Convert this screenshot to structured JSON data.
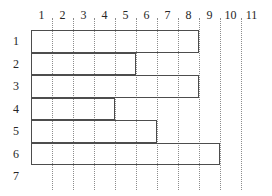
{
  "chart_data": {
    "type": "bar",
    "orientation": "horizontal",
    "title": "",
    "xlabel": "",
    "ylabel": "",
    "grid": true,
    "legend": null,
    "column_headers": [
      "1",
      "2",
      "3",
      "4",
      "5",
      "6",
      "7",
      "8",
      "9",
      "10",
      "11"
    ],
    "row_labels": [
      "1",
      "2",
      "3",
      "4",
      "5",
      "6",
      "7"
    ],
    "categories": [
      "1",
      "2",
      "3",
      "4",
      "5",
      "6",
      "7"
    ],
    "values": [
      8,
      5,
      8,
      4,
      6,
      9,
      0
    ],
    "xlim": [
      1,
      11
    ],
    "ylim": [
      1,
      7
    ],
    "bars": [
      {
        "row": "1",
        "start": 1,
        "end": 9,
        "length": 8
      },
      {
        "row": "2",
        "start": 1,
        "end": 6,
        "length": 5
      },
      {
        "row": "3",
        "start": 1,
        "end": 9,
        "length": 8
      },
      {
        "row": "4",
        "start": 1,
        "end": 5,
        "length": 4
      },
      {
        "row": "5",
        "start": 1,
        "end": 7,
        "length": 6
      },
      {
        "row": "6",
        "start": 1,
        "end": 10,
        "length": 9
      },
      {
        "row": "7",
        "start": 1,
        "end": 1,
        "length": 0
      }
    ],
    "colors": {
      "bar_stroke": "#4d4d4d",
      "bar_fill": "transparent",
      "gridline": "#8c8c8c",
      "text": "#262626",
      "background": "#ffffff"
    }
  }
}
